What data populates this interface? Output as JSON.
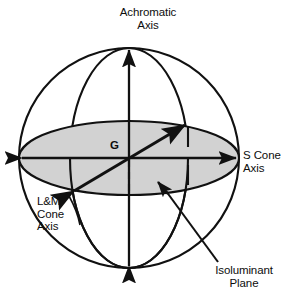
{
  "figure": {
    "title_text": "",
    "background_color": "#ffffff",
    "stroke_color": "#111111",
    "plane_fill_color": "#d2d2d2"
  },
  "labels": {
    "achromatic_axis": "Achromatic\nAxis",
    "s_cone_axis": "S Cone\nAxis",
    "lm_cone_axis": "L&M\nCone\nAxis",
    "isoluminant_plane": "Isoluminant\nPlane",
    "origin": "G"
  },
  "geometry": {
    "sphere": {
      "cx": 129,
      "cy": 158,
      "r": 110
    },
    "equator_ellipse": {
      "cx": 129,
      "cy": 158,
      "rx": 110,
      "ry": 37
    },
    "meridian_ellipse": {
      "cx": 129,
      "cy": 158,
      "rx": 59,
      "ry": 110
    },
    "achromatic_axis": {
      "x1": 129,
      "y1": 268,
      "x2": 129,
      "y2": 48
    },
    "s_cone_axis": {
      "x1": 20,
      "y1": 158,
      "x2": 238,
      "y2": 158
    },
    "lm_cone_axis": {
      "x1": 72,
      "y1": 193,
      "x2": 187,
      "y2": 123
    },
    "pointer_arrow": {
      "tip_x": 157,
      "tip_y": 181,
      "tail_x": 214,
      "tail_y": 258
    }
  }
}
